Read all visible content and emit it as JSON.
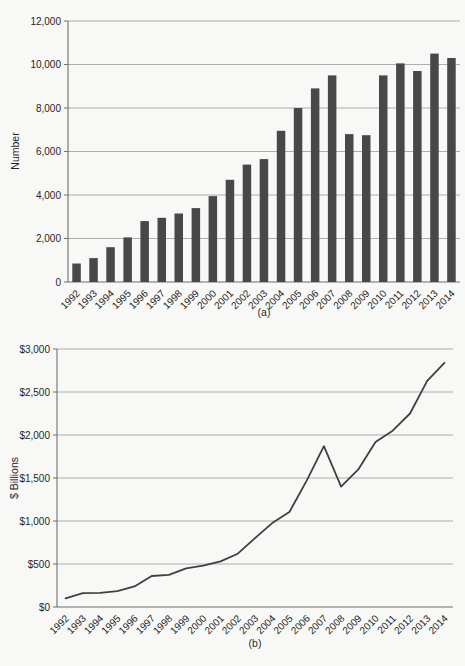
{
  "style": {
    "page_background": "#f8f8f6",
    "grid_color": "#9a9a9a",
    "axis_color": "#6f6f6f",
    "text_color": "#262626"
  },
  "chart_data": [
    {
      "id": "a",
      "type": "bar",
      "caption": "(a)",
      "ylabel": "Number",
      "xlabel": "",
      "grid": true,
      "legend": "none",
      "color": "#484848",
      "ylim": [
        0,
        12000
      ],
      "ytick_labels": [
        "0",
        "2,000",
        "4,000",
        "6,000",
        "8,000",
        "10,000",
        "12,000"
      ],
      "categories": [
        "1992",
        "1993",
        "1994",
        "1995",
        "1996",
        "1997",
        "1998",
        "1999",
        "2000",
        "2001",
        "2002",
        "2003",
        "2004",
        "2005",
        "2006",
        "2007",
        "2008",
        "2009",
        "2010",
        "2011",
        "2012",
        "2013",
        "2014"
      ],
      "values": [
        850,
        1100,
        1600,
        2050,
        2800,
        2950,
        3150,
        3400,
        3950,
        4700,
        5400,
        5650,
        6950,
        8000,
        8900,
        9500,
        6800,
        6750,
        9500,
        10050,
        9700,
        10500,
        10300
      ]
    },
    {
      "id": "b",
      "type": "line",
      "caption": "(b)",
      "ylabel": "$ Billions",
      "xlabel": "",
      "grid": true,
      "legend": "none",
      "color": "#404040",
      "ylim": [
        0,
        3000
      ],
      "ytick_labels": [
        "$0",
        "$500",
        "$1,000",
        "$1,500",
        "$2,000",
        "$2,500",
        "$3,000"
      ],
      "categories": [
        "1992",
        "1993",
        "1994",
        "1995",
        "1996",
        "1997",
        "1998",
        "1999",
        "2000",
        "2001",
        "2002",
        "2003",
        "2004",
        "2005",
        "2006",
        "2007",
        "2008",
        "2009",
        "2010",
        "2011",
        "2012",
        "2013",
        "2014"
      ],
      "values": [
        100,
        160,
        165,
        185,
        240,
        360,
        375,
        450,
        480,
        530,
        620,
        800,
        975,
        1105,
        1470,
        1870,
        1400,
        1600,
        1920,
        2050,
        2250,
        2630,
        2840
      ]
    }
  ]
}
